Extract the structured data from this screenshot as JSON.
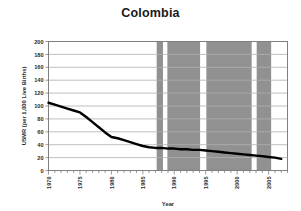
{
  "chart_data": {
    "type": "line",
    "title": "Colombia",
    "xlabel": "Year",
    "ylabel": "U5MR (per 1,000 Live Births)",
    "xlim": [
      1970,
      2008
    ],
    "ylim": [
      0,
      200
    ],
    "grid": true,
    "legend": null,
    "xticks": [
      1970,
      1975,
      1980,
      1985,
      1990,
      1995,
      2000,
      2005
    ],
    "yticks": [
      0,
      20,
      40,
      60,
      80,
      100,
      120,
      140,
      160,
      180,
      200
    ],
    "minor_xtick_interval": 1,
    "line_color": "#000000",
    "shade_color": "#919191",
    "grid_color": "#b0b0b0",
    "axis_color": "#808080",
    "series": [
      {
        "name": "U5MR",
        "x": [
          1970,
          1971,
          1972,
          1973,
          1974,
          1975,
          1976,
          1977,
          1978,
          1979,
          1980,
          1981,
          1982,
          1983,
          1984,
          1985,
          1986,
          1987,
          1988,
          1989,
          1990,
          1991,
          1992,
          1993,
          1994,
          1995,
          1996,
          1997,
          1998,
          1999,
          2000,
          2001,
          2002,
          2003,
          2004,
          2005,
          2006,
          2007
        ],
        "values": [
          105,
          102,
          99,
          96,
          93,
          90,
          83,
          75,
          67,
          59,
          52,
          50,
          47,
          44,
          41,
          38,
          36,
          35,
          35,
          34,
          34,
          33,
          33,
          32,
          32,
          31,
          30,
          29,
          28,
          27,
          26,
          25,
          24,
          23,
          22,
          21,
          20,
          18
        ]
      }
    ],
    "shaded_bands": [
      {
        "label": "band-1",
        "x_start": 1987.2,
        "x_end": 1988.2
      },
      {
        "label": "band-2",
        "x_start": 1988.9,
        "x_end": 1994.1
      },
      {
        "label": "band-3",
        "x_start": 1995.1,
        "x_end": 2002.3
      },
      {
        "label": "band-4",
        "x_start": 2003.1,
        "x_end": 2005.4
      }
    ]
  }
}
